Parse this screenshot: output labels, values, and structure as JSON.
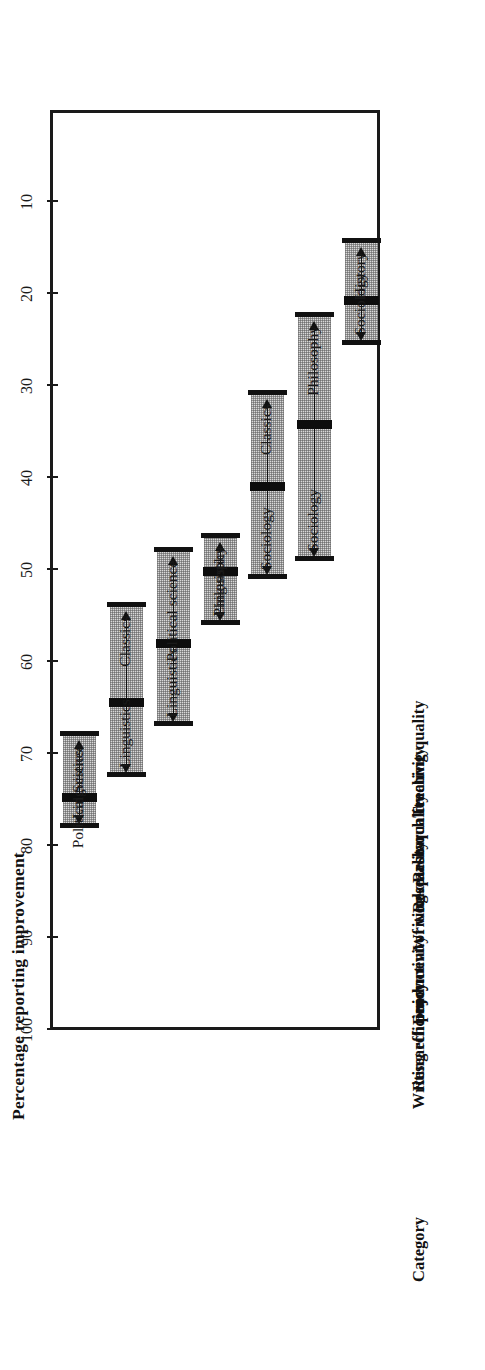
{
  "figure": {
    "axis_title": "Percentage reporting improvement",
    "category_header": "Category"
  },
  "chart_data": {
    "type": "bar",
    "orientation": "horizontal-range",
    "title": "",
    "xlabel": "Percentage reporting improvement",
    "ylabel": "Category",
    "xlim": [
      0,
      100
    ],
    "grid": false,
    "legend": "none",
    "tick_labels": [
      "10",
      "20",
      "30",
      "40",
      "50",
      "60",
      "70",
      "80",
      "90",
      "100"
    ],
    "tick_values": [
      10,
      20,
      30,
      40,
      50,
      60,
      70,
      80,
      90,
      100
    ],
    "categories": [
      "Writing efficiency",
      "Research productivity",
      "Enjoyment of work",
      "Writing quality",
      "Research quality",
      "Research creativity",
      "Teaching quality"
    ],
    "series": [
      {
        "name": "Range low",
        "values": [
          68.0,
          54.0,
          48.0,
          46.5,
          31.0,
          22.5,
          14.5
        ]
      },
      {
        "name": "Overall",
        "values": [
          74.8,
          64.5,
          58.0,
          50.2,
          41.0,
          34.2,
          20.8
        ]
      },
      {
        "name": "Range high",
        "values": [
          78.0,
          72.5,
          67.0,
          56.0,
          51.0,
          49.0,
          25.5
        ]
      }
    ],
    "rows": [
      {
        "category": "Writing efficiency",
        "low": 68.0,
        "value": 74.8,
        "high": 78.0,
        "low_label": "Political Science",
        "high_label": "Linguistics"
      },
      {
        "category": "Research productivity",
        "low": 54.0,
        "value": 64.5,
        "high": 72.5,
        "low_label": "Classics",
        "high_label": "Linguistics"
      },
      {
        "category": "Enjoyment of work",
        "low": 48.0,
        "value": 58.0,
        "high": 67.0,
        "low_label": "Political science",
        "high_label": "Linguistics"
      },
      {
        "category": "Writing quality",
        "low": 46.5,
        "value": 50.2,
        "high": 56.0,
        "low_label": "Philosophy",
        "high_label": "Linguistics"
      },
      {
        "category": "Research quality",
        "low": 31.0,
        "value": 41.0,
        "high": 51.0,
        "low_label": "Classics",
        "high_label": "Sociology"
      },
      {
        "category": "Research creativity",
        "low": 22.5,
        "value": 34.2,
        "high": 49.0,
        "low_label": "Philosophy",
        "high_label": "Sociology"
      },
      {
        "category": "Teaching quality",
        "low": 14.5,
        "value": 20.8,
        "high": 25.5,
        "low_label": "History",
        "high_label": "Sociology"
      }
    ],
    "colors": {
      "ink": "#111111",
      "range_fill": "#d9d9d9",
      "frame": "#1a1a1a"
    }
  }
}
